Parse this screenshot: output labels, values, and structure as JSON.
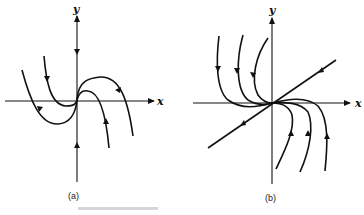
{
  "figure": {
    "panels": [
      {
        "id": "a",
        "caption": "(a)",
        "x_label": "x",
        "y_label": "y",
        "description": "Phase portrait with S-shaped (cubic-like) trajectories through origin; y-axis is an invariant line with arrows pointing toward origin; curves arrive along trajectories and leave to lower right"
      },
      {
        "id": "b",
        "caption": "(b)",
        "x_label": "x",
        "y_label": "y",
        "description": "Phase portrait with a straight-line trajectory through origin (arrows pointing away from origin) and three curved trajectories on each side that approach origin tangentially to the x-axis"
      }
    ],
    "partial_caption": ""
  }
}
